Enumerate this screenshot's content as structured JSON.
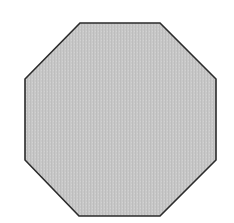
{
  "shape": {
    "type": "octagon",
    "fill": "#c6c6c6",
    "stroke": "#2b2b2b",
    "stroke_width": 1.6,
    "vertices": [
      [
        80,
        23
      ],
      [
        160,
        23
      ],
      [
        216,
        79
      ],
      [
        216,
        160
      ],
      [
        160,
        216
      ],
      [
        79,
        216
      ],
      [
        25,
        160
      ],
      [
        25,
        79
      ]
    ]
  }
}
